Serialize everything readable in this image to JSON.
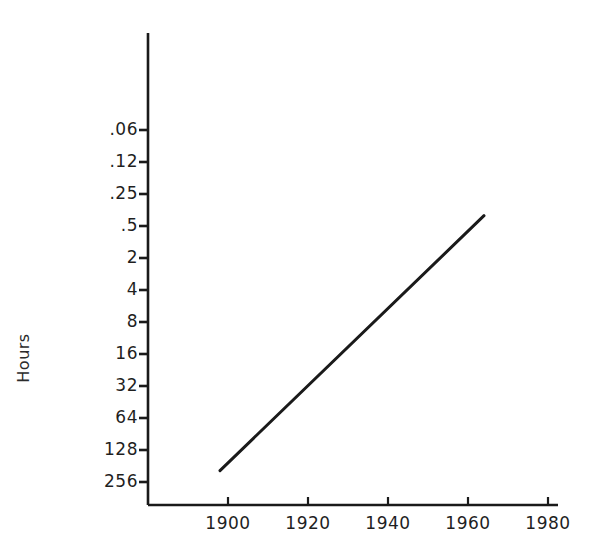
{
  "chart_data": {
    "type": "line",
    "title": "",
    "xlabel": "",
    "ylabel": "Hours",
    "x_tick_labels": [
      "1900",
      "1920",
      "1940",
      "1960",
      "1980"
    ],
    "x_tick_values": [
      1900,
      1920,
      1940,
      1960,
      1980
    ],
    "xlim": [
      1893,
      1987
    ],
    "y_tick_labels": [
      ".06",
      ".12",
      ".25",
      ".5",
      "2",
      "4",
      "8",
      "16",
      "32",
      "64",
      "128",
      "256"
    ],
    "y_tick_values": [
      0.06,
      0.12,
      0.25,
      0.5,
      2,
      4,
      8,
      16,
      32,
      64,
      128,
      256
    ],
    "y_axis_scale": "log-inverted",
    "y_axis_note": "Values decrease upward; tick spacing uniform, one step per halving",
    "grid": false,
    "legend": null,
    "series": [
      {
        "name": "Hours",
        "x": [
          1898,
          1964
        ],
        "values": [
          200,
          0.4
        ],
        "line_color": "#1a1a1a",
        "line_width": 3
      }
    ],
    "annotations": []
  },
  "axis": {
    "y_axis_color": "#1a1a1a",
    "x_axis_color": "#1a1a1a",
    "tick_color": "#1a1a1a"
  },
  "figure": {
    "background": "#ffffff",
    "width": 593,
    "height": 556
  }
}
